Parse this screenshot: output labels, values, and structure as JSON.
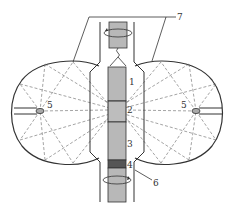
{
  "diagram": {
    "type": "optical floating-zone furnace cross-section",
    "labels": {
      "feed_rod": "1",
      "molten_zone": "2",
      "grown_crystal": "3",
      "seed": "4",
      "lamp_left": "5",
      "lamp_right": "5",
      "quartz_tube": "6",
      "ellipsoidal_mirrors": "7"
    },
    "colors": {
      "line": "#333333",
      "rod_fill": "#b8b8b8",
      "seed_fill": "#555555",
      "dashed_rays": "#555555",
      "background": "#ffffff"
    }
  }
}
